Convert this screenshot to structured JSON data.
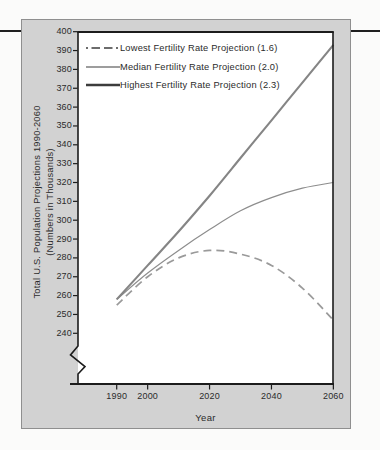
{
  "labels": {
    "y_axis_line1": "Total U.S. Population Projections 1990-2060",
    "y_axis_line2": "(Numbers in Thousands)",
    "x_axis_title": "Year"
  },
  "chart_data": {
    "type": "line",
    "title": "",
    "xlabel": "Year",
    "ylabel": "Total U.S. Population Projections 1990-2060 (Numbers in Thousands)",
    "x": [
      1990,
      2000,
      2010,
      2020,
      2030,
      2040,
      2050,
      2060
    ],
    "series": [
      {
        "name": "Lowest Fertility Rate Projection (1.6)",
        "style": "dashed",
        "color": "#9a9a9a",
        "values": [
          255,
          270,
          280,
          284,
          282,
          276,
          264,
          247
        ]
      },
      {
        "name": "Median Fertility Rate Projection (2.0)",
        "style": "thin-solid",
        "color": "#8d8d8d",
        "values": [
          258,
          272,
          284,
          295,
          305,
          312,
          317,
          320
        ]
      },
      {
        "name": "Highest Fertility Rate Projection (2.3)",
        "style": "thick-solid",
        "color": "#858585",
        "values": [
          258,
          276,
          294,
          313,
          333,
          353,
          373,
          393
        ]
      }
    ],
    "y_ticks": [
      400,
      390,
      380,
      370,
      360,
      350,
      340,
      330,
      320,
      310,
      300,
      290,
      280,
      270,
      260,
      250,
      240
    ],
    "x_ticks": [
      1990,
      2000,
      2020,
      2040,
      2060
    ],
    "ylim": [
      240,
      400
    ],
    "xlim": [
      1990,
      2060
    ],
    "axis_break_below_y": 240,
    "grid": false,
    "legend_position": "top-left"
  },
  "colors": {
    "page_rule": "#1f1f1f",
    "panel_bg": "#d2d2d2",
    "panel_border": "#8f8f8f",
    "plot_bg": "#ffffff",
    "axis": "#1c1c1c",
    "text": "#2b2b2b",
    "legend_swatch": "#3c3c3c"
  }
}
